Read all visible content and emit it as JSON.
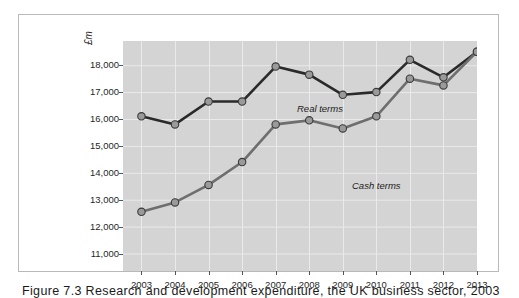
{
  "figure": {
    "caption": "Figure 7.3  Research and development expenditure, the UK business sector, 2003 – 2013"
  },
  "chart_data": {
    "type": "line",
    "title": "",
    "subtitle": "",
    "xlabel": "",
    "ylabel": "£m",
    "y_unit_label": "£m",
    "categories": [
      "2003",
      "2004",
      "2005",
      "2006",
      "2007",
      "2008",
      "2009",
      "2010",
      "2011",
      "2012",
      "2013"
    ],
    "x": [
      2003,
      2004,
      2005,
      2006,
      2007,
      2008,
      2009,
      2010,
      2011,
      2012,
      2013
    ],
    "xlim": [
      2002.45,
      2013.0
    ],
    "ylim": [
      10350,
      18900
    ],
    "ytick_labels": [
      "18,000",
      "17,000",
      "16,000",
      "15,000",
      "14,000",
      "13,000",
      "12,000",
      "11,000"
    ],
    "yticks": [
      18000,
      17000,
      16000,
      15000,
      14000,
      13000,
      12000,
      11000
    ],
    "grid": true,
    "grid_color": "#eaeaea",
    "plot_background": "#d4d4d4",
    "legend": "annotations-on-plot",
    "series": [
      {
        "name": "Real terms",
        "annotation": "Real terms",
        "line_color": "#2a2a2a",
        "marker_color": "#9a9a9a",
        "values": [
          16100,
          15800,
          16650,
          16650,
          17950,
          17650,
          16900,
          17000,
          18200,
          17550,
          18500
        ]
      },
      {
        "name": "Cash terms",
        "annotation": "Cash terms",
        "line_color": "#6e6e6e",
        "marker_color": "#9a9a9a",
        "values": [
          12550,
          12900,
          13550,
          14400,
          15800,
          15950,
          15650,
          16100,
          17500,
          17250,
          18500
        ]
      }
    ]
  }
}
